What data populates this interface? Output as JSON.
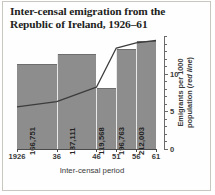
{
  "figure": {
    "title": "Inter-censal emigration from the Republic of Ireland, 1926–61",
    "xlabel": "Inter-censal period",
    "ylabel_line1": "Emigrants per 1000",
    "ylabel_line2_prefix": "population (",
    "ylabel_line2_em": "red line",
    "ylabel_line2_suffix": ")"
  },
  "colors": {
    "bar_fill": "#8d8d8d",
    "bar_edge": "#6d6d6d",
    "line": "#3c3c3c",
    "axis": "#4a4a4a",
    "text": "#231f1c",
    "frame": "#c9c6c0",
    "background": "#fefefe"
  },
  "chart_data": {
    "type": "bar",
    "title": "Inter-censal emigration from the Republic of Ireland, 1926–61",
    "xlabel": "Inter-censal period",
    "ylabel": "Emigrants per 1000 population (red line)",
    "grid": false,
    "legend": "none",
    "x_tick_labels": [
      "1926",
      "36",
      "46",
      "51",
      "56",
      "61"
    ],
    "x_tick_positions": [
      1926,
      1936,
      1946,
      1951,
      1956,
      1961
    ],
    "xlim": [
      1926,
      1961
    ],
    "categories": [
      "1926–36",
      "1936–46",
      "1946–51",
      "1951–56",
      "1956–61"
    ],
    "series": [
      {
        "name": "Total emigrants (bars)",
        "type": "bar",
        "value_labels": [
          "166,751",
          "187,111",
          "119,568",
          "196,763",
          "212,003"
        ],
        "values": [
          166751,
          187111,
          119568,
          196763,
          212003
        ],
        "bar_spans": [
          [
            1926,
            1936
          ],
          [
            1936,
            1946
          ],
          [
            1946,
            1951
          ],
          [
            1951,
            1956
          ],
          [
            1956,
            1961
          ]
        ]
      },
      {
        "name": "Emigrants per 1000 population (red line)",
        "type": "line",
        "x": [
          1926,
          1936,
          1946,
          1951,
          1956,
          1961
        ],
        "values": [
          5.6,
          6.3,
          8.2,
          13.4,
          14.1,
          14.4
        ]
      }
    ],
    "y_right_axis": {
      "label": "Emigrants per 1000 population (red line)",
      "ylim": [
        0,
        15
      ],
      "major_ticks": [
        0,
        5,
        10
      ],
      "major_tick_labels": [
        "0",
        "5",
        "10"
      ],
      "minor_tick_interval": 1
    }
  }
}
